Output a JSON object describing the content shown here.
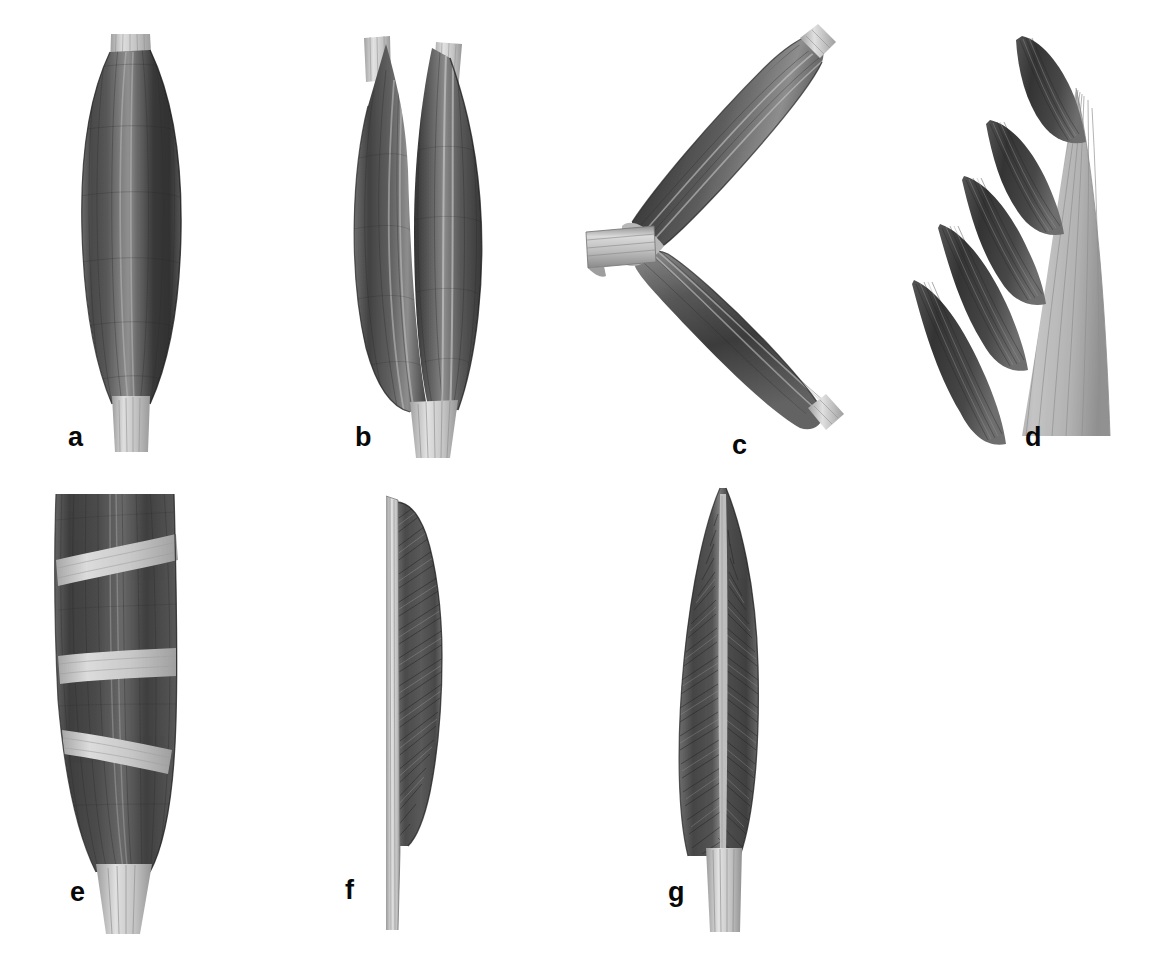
{
  "figure": {
    "background_color": "#ffffff",
    "width": 1162,
    "height": 953,
    "medium": "halftone anatomical illustration, grayscale",
    "label_color": "#080808"
  },
  "palette": {
    "muscle_dark": "#3b3b3b",
    "muscle_mid": "#555555",
    "muscle_light": "#6e6e6e",
    "muscle_highlight": "#8d8d8d",
    "tendon_light": "#d8d8d8",
    "tendon_mid": "#bdbdbd",
    "tendon_shadow": "#9a9a9a",
    "outline": "#2b2b2b",
    "background": "#ffffff"
  },
  "panels": [
    {
      "id": "a",
      "label": "a",
      "name": "fusiform-muscle",
      "description": "Fusiform (spindle-shaped) muscle: single elongated belly widest at its middle, tapering to a narrow tendon at each end; fibers run parallel to the long axis.",
      "tendons": 2,
      "bellies": 1,
      "fiber_direction": "longitudinal-parallel",
      "label_position": {
        "x": 68,
        "y": 424
      }
    },
    {
      "id": "b",
      "label": "b",
      "name": "bicipital-muscle",
      "description": "Bicipital (two-headed) muscle: two separate proximal heads with their own tendons merge into a single fleshy belly that ends in one distal tendon.",
      "tendons": 3,
      "bellies": 2,
      "heads": 2,
      "fiber_direction": "longitudinal-converging",
      "label_position": {
        "x": 355,
        "y": 424
      }
    },
    {
      "id": "c",
      "label": "c",
      "name": "digastric-muscle",
      "description": "Digastric (two-bellied) muscle: two bellies angled in a V meeting at an intermediate tendon that is held by a fibrous sling or pulley loop.",
      "tendons": 3,
      "bellies": 2,
      "intermediate_tendon": true,
      "fibrous_sling": true,
      "fiber_direction": "longitudinal, angled bellies",
      "label_position": {
        "x": 730,
        "y": 432
      }
    },
    {
      "id": "d",
      "label": "d",
      "name": "serratus-multipennate-muscle",
      "description": "Serrated / multi-digitated muscle: a row of five saw-tooth muscular digitations sweeping obliquely into a broad flat aponeurosis on the right.",
      "digitations": 5,
      "aponeurosis": true,
      "fiber_direction": "oblique-radiating",
      "label_position": {
        "x": 1025,
        "y": 424
      }
    },
    {
      "id": "e",
      "label": "e",
      "name": "polygastric-multibellied-muscle",
      "description": "Polygastric (multi-bellied) strap muscle: a broad band of longitudinal fibers interrupted by three pale transverse tendinous intersections, narrowing to a tendon below.",
      "tendinous_intersections": 3,
      "bellies": 4,
      "fiber_direction": "longitudinal, segmented",
      "label_position": {
        "x": 70,
        "y": 879
      }
    },
    {
      "id": "f",
      "label": "f",
      "name": "unipennate-muscle",
      "description": "Unipennate muscle: fibers insert obliquely onto only one side of a tendon that runs along the whole length of the left border, like one half of a feather.",
      "pennation": "unipennate",
      "fiber_direction": "oblique, one side of tendon",
      "label_position": {
        "x": 345,
        "y": 877
      }
    },
    {
      "id": "g",
      "label": "g",
      "name": "bipennate-muscle",
      "description": "Bipennate muscle: fibers pass obliquely to both sides of a central tendon, producing a feather-like appearance; the tendon emerges inferiorly.",
      "pennation": "bipennate",
      "fiber_direction": "oblique, both sides of central tendon",
      "label_position": {
        "x": 668,
        "y": 879
      }
    }
  ]
}
